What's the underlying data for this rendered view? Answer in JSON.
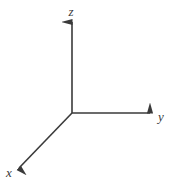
{
  "figure": {
    "kind": "3d-cartesian-axes-diagram",
    "width": 174,
    "height": 187,
    "background_color": "#ffffff",
    "stroke_color": "#3a3a3a",
    "stroke_width": 1.6,
    "origin": {
      "x": 72,
      "y": 113
    }
  },
  "chart_data": {
    "type": "diagram",
    "title": "",
    "subtitle": "",
    "xlabel": "",
    "ylabel": "",
    "grid": false,
    "legend": null,
    "annotations": [],
    "origin": {
      "x": 72,
      "y": 113
    },
    "axes": [
      {
        "name": "z",
        "label": "z",
        "direction": "up",
        "start": {
          "x": 72,
          "y": 113
        },
        "end": {
          "x": 72,
          "y": 22
        },
        "arrow": true,
        "label_pos": {
          "x": 71,
          "y": 16
        }
      },
      {
        "name": "y",
        "label": "y",
        "direction": "right",
        "start": {
          "x": 72,
          "y": 113
        },
        "end": {
          "x": 150,
          "y": 113
        },
        "arrow": true,
        "label_pos": {
          "x": 161,
          "y": 121
        }
      },
      {
        "name": "x",
        "label": "x",
        "direction": "down-left",
        "start": {
          "x": 72,
          "y": 113
        },
        "end": {
          "x": 19,
          "y": 168
        },
        "arrow": true,
        "label_pos": {
          "x": 9,
          "y": 177
        }
      }
    ]
  },
  "labels": {
    "z": "z",
    "y": "y",
    "x": "x"
  }
}
